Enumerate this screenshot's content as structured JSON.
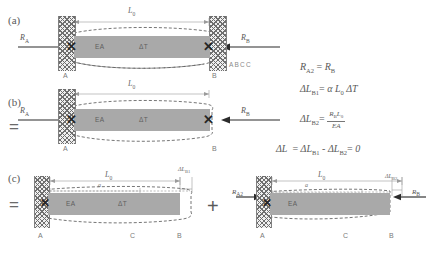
{
  "figure": {
    "panels": [
      {
        "tag": "(a)",
        "equals_prefix": "",
        "dimension_top": "L0",
        "bar_labels": [
          "EA",
          "ΔT"
        ],
        "node_labels": [
          "A",
          "B"
        ],
        "reactions": [
          "RA",
          "RB"
        ],
        "note": "ABCC"
      },
      {
        "tag": "(b)",
        "equals_prefix": "=",
        "dimension_top": "L0",
        "bar_labels": [
          "EA",
          "ΔT"
        ],
        "node_labels": [
          "A",
          "B"
        ],
        "reactions": [
          "RA",
          "RB"
        ]
      },
      {
        "tag": "(c)",
        "equals_prefix": "=",
        "plus_sign": "+",
        "left": {
          "dimension_top": "L0",
          "dimension_inner": "a",
          "delta_label": "ΔLB1",
          "bar_labels": [
            "EA",
            "ΔT"
          ],
          "node_labels": [
            "A",
            "C",
            "B"
          ]
        },
        "right": {
          "dimension_top": "L0",
          "dimension_inner": "a",
          "delta_label": "ΔLB2",
          "bar_labels": [
            "EA"
          ],
          "node_labels": [
            "A",
            "C",
            "B"
          ],
          "reactions": [
            "RA2",
            "RB"
          ]
        }
      }
    ],
    "equations": [
      {
        "id": "eq-reaction-equality",
        "lhs": "RA2",
        "rhs": "RB",
        "text": "R_A2 = R_B"
      },
      {
        "id": "eq-thermal-elongation",
        "lhs": "ΔLB1",
        "rhs": "α L0 ΔT",
        "text": "ΔL_B1 = α L_0 ΔT"
      },
      {
        "id": "eq-mechanical-shortening",
        "lhs": "ΔLB2",
        "numerator": "RB L0",
        "denominator": "EA",
        "text": "ΔL_B2 = R_B L_0 / (EA)"
      },
      {
        "id": "eq-compatibility",
        "lhs": "ΔL",
        "rhs": "ΔLB1 - ΔLB2 = 0",
        "text": "ΔL = ΔL_B1 - ΔL_B2 = 0"
      }
    ],
    "symbols": {
      "alpha": "α",
      "delta": "Δ",
      "x_marker": "✕",
      "equals": "=",
      "plus": "+"
    },
    "colors": {
      "bar_fill": "#a9a9a9",
      "wall_hatch": "#6e6e6e",
      "dashed_outline": "#5d5d5d",
      "dimension_line": "#9a9a9a",
      "arrow": "#2b2b2b",
      "text": "#5a5a5a",
      "background": "#ffffff"
    }
  }
}
